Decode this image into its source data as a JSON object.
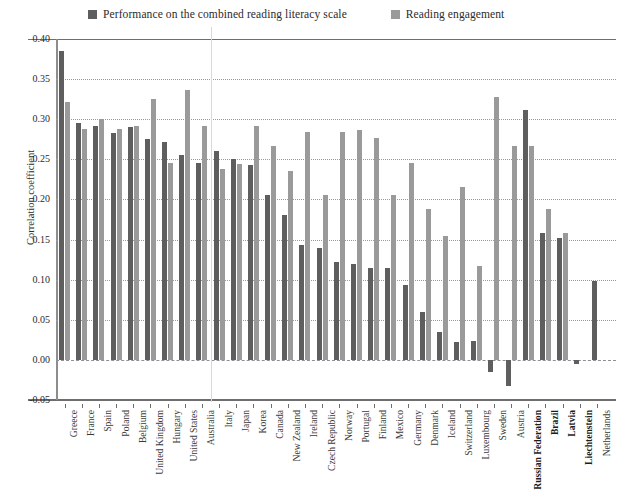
{
  "chart_data": {
    "type": "bar",
    "title": "",
    "xlabel": "",
    "ylabel": "Correlation coefficient",
    "ylim": [
      -0.05,
      0.4
    ],
    "ytick_step": 0.05,
    "yticks": [
      "0.40",
      "0.35",
      "0.30",
      "0.25",
      "0.20",
      "0.15",
      "0.10",
      "0.05",
      "0.00",
      "-0.05"
    ],
    "grid": true,
    "legend_position": "top",
    "categories": [
      "Greece",
      "France",
      "Spain",
      "Poland",
      "Belgium",
      "United Kingdom",
      "Hungary",
      "United States",
      "Australia",
      "Italy",
      "Japan",
      "Korea",
      "Canada",
      "New Zealand",
      "Ireland",
      "Czech Republic",
      "Norway",
      "Portugal",
      "Finland",
      "Mexico",
      "Germany",
      "Denmark",
      "Iceland",
      "Switzerland",
      "Luxembourg",
      "Sweden",
      "Austria",
      "Russian Federation",
      "Brazil",
      "Latvia",
      "Liechtenstein",
      "Netherlands"
    ],
    "partner_categories": [
      "Russian Federation",
      "Brazil",
      "Latvia",
      "Liechtenstein"
    ],
    "series": [
      {
        "name": "Performance on the combined reading literacy scale",
        "color": "#5e5e5e",
        "values": [
          0.385,
          0.295,
          0.292,
          0.283,
          0.29,
          0.275,
          0.272,
          0.255,
          0.245,
          0.26,
          0.25,
          0.243,
          0.205,
          0.18,
          0.143,
          0.14,
          0.122,
          0.12,
          0.115,
          0.115,
          0.093,
          0.06,
          0.035,
          0.022,
          0.023,
          -0.015,
          -0.032,
          0.312,
          0.158,
          0.152,
          -0.005,
          0.098
        ]
      },
      {
        "name": "Reading engagement",
        "color": "#9a9a9a",
        "values": [
          0.322,
          0.288,
          0.3,
          0.288,
          0.292,
          0.325,
          0.246,
          0.337,
          0.292,
          0.238,
          0.244,
          0.292,
          0.266,
          0.235,
          0.284,
          0.205,
          0.284,
          0.286,
          0.276,
          0.205,
          0.246,
          0.188,
          0.155,
          0.215,
          0.117,
          0.328,
          0.266,
          0.266,
          0.188,
          0.158,
          0.0,
          0.0
        ]
      }
    ],
    "series_note": "Reading engagement values are aligned to categories in order; the last two entries are placeholders not drawn."
  },
  "legend": {
    "items": [
      {
        "label": "Performance on the combined reading literacy scale",
        "color": "#5e5e5e",
        "swatch": "legend-swatch-dark"
      },
      {
        "label": "Reading engagement",
        "color": "#9a9a9a",
        "swatch": "legend-swatch-light"
      }
    ]
  },
  "axis": {
    "y_title": "Correlation coefficient"
  }
}
